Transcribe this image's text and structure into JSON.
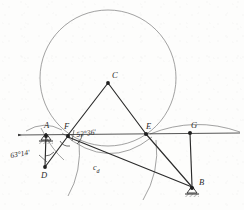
{
  "figure": {
    "kind": "geometric-construction-drawing",
    "background_color": "#fdfdfc",
    "ink_color": "#2b2b2b",
    "construction_color": "#6b6b6b",
    "width": 244,
    "height": 210
  },
  "points": [
    {
      "id": "A",
      "label": "A",
      "x": 46,
      "y": 134,
      "marker": "support-triangle",
      "label_dx": -2,
      "label_dy": -13
    },
    {
      "id": "B",
      "label": "B",
      "x": 192,
      "y": 188,
      "marker": "support-triangle",
      "label_dx": 7,
      "label_dy": -10
    },
    {
      "id": "C",
      "label": "C",
      "x": 108,
      "y": 82,
      "marker": "dot",
      "label_dx": 4,
      "label_dy": -11
    },
    {
      "id": "D",
      "label": "D",
      "x": 45,
      "y": 168,
      "marker": "dot",
      "label_dx": -2,
      "label_dy": 4
    },
    {
      "id": "E",
      "label": "E",
      "x": 146,
      "y": 134,
      "marker": "dot",
      "label_dx": 1,
      "label_dy": -12
    },
    {
      "id": "F",
      "label": "F",
      "x": 68,
      "y": 135,
      "marker": "dot",
      "label_dx": -1,
      "label_dy": -13
    },
    {
      "id": "G",
      "label": "G",
      "x": 190,
      "y": 133,
      "marker": "dot",
      "label_dx": 2,
      "label_dy": -12
    }
  ],
  "annotations": {
    "angle_left": {
      "text": "63°14'",
      "x": 11,
      "y": 158
    },
    "angle_right": {
      "text": "52°36'",
      "x": 76,
      "y": 138
    },
    "segment_label": {
      "text": "c",
      "subscript": "d",
      "x": 93,
      "y": 172
    }
  },
  "segments": [
    {
      "from": "F",
      "to": "C"
    },
    {
      "from": "C",
      "to": "E"
    },
    {
      "from": "E",
      "to": "B"
    },
    {
      "from": "F",
      "to": "B"
    },
    {
      "from": "A",
      "to": "D"
    },
    {
      "from": "D",
      "to": "F"
    },
    {
      "from": "G",
      "to": "B"
    }
  ],
  "baseline": {
    "x1": 18,
    "y1": 135,
    "x2": 240,
    "y2": 133,
    "has_arrow_left": true
  },
  "construction_arcs": [
    {
      "name": "large-circle-through-F-E",
      "cx": 108,
      "cy": 78,
      "r": 68
    },
    {
      "name": "arc-below-from-F",
      "cx": 68,
      "cy": 135,
      "r": 45
    },
    {
      "name": "arc-below-from-E",
      "cx": 146,
      "cy": 134,
      "r": 45
    },
    {
      "name": "arc-right-over-G",
      "cx": 190,
      "cy": 160,
      "r": 32
    },
    {
      "name": "arc-left-small-A",
      "cx": 46,
      "cy": 134,
      "r": 20
    },
    {
      "name": "arc-lens-F-E",
      "cx": 107,
      "cy": 100,
      "r": 48
    }
  ]
}
